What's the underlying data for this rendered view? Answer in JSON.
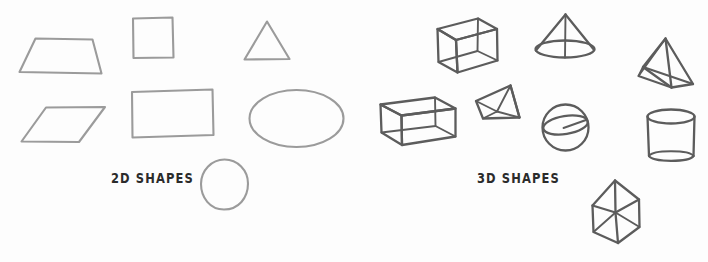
{
  "page": {
    "background_color": "#fdfdfd",
    "width": 708,
    "height": 262
  },
  "groups": {
    "two_d": {
      "caption": "2D SHAPES",
      "stroke_color": "#9b9b9b",
      "shapes": [
        {
          "name": "trapezoid",
          "label": "Trapezoid"
        },
        {
          "name": "square",
          "label": "Square"
        },
        {
          "name": "triangle",
          "label": "Triangle"
        },
        {
          "name": "parallelogram",
          "label": "Parallelogram"
        },
        {
          "name": "rectangle",
          "label": "Rectangle"
        },
        {
          "name": "ellipse",
          "label": "Ellipse"
        },
        {
          "name": "circle",
          "label": "Circle"
        }
      ]
    },
    "three_d": {
      "caption": "3D SHAPES",
      "stroke_color": "#5c5c5c",
      "shapes": [
        {
          "name": "cube",
          "label": "Cube"
        },
        {
          "name": "cone",
          "label": "Cone"
        },
        {
          "name": "tetrahedron",
          "label": "Tetrahedron"
        },
        {
          "name": "cuboid",
          "label": "Cuboid"
        },
        {
          "name": "pyramid",
          "label": "Square Pyramid"
        },
        {
          "name": "sphere",
          "label": "Sphere"
        },
        {
          "name": "cylinder",
          "label": "Cylinder"
        },
        {
          "name": "triangular-prism",
          "label": "Triangular Prism"
        }
      ]
    }
  }
}
